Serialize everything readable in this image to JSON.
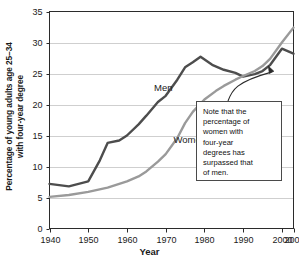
{
  "chart_data": {
    "type": "line",
    "title": "",
    "xlabel": "Year",
    "ylabel_line1": "Percentage of young adults age 25–34",
    "ylabel_line2": "with four-year degree",
    "xlim": [
      1940,
      2003
    ],
    "ylim": [
      0,
      35
    ],
    "grid": true,
    "legend": "inline-series-labels",
    "yticks": [
      "0",
      "5",
      "10",
      "15",
      "20",
      "25",
      "30",
      "35"
    ],
    "ytick_values": [
      0,
      5,
      10,
      15,
      20,
      25,
      30,
      35
    ],
    "xticks": [
      "1940",
      "1950",
      "1960",
      "1970",
      "1980",
      "1990",
      "2000",
      "2003"
    ],
    "xtick_values": [
      1940,
      1950,
      1960,
      1970,
      1980,
      1990,
      2000,
      2003
    ],
    "series": [
      {
        "name": "Men",
        "color": "#4d4d4d",
        "label_x": 1967,
        "label_y": 22.6,
        "x": [
          1940,
          1945,
          1950,
          1953,
          1955,
          1958,
          1960,
          1963,
          1965,
          1968,
          1970,
          1973,
          1975,
          1977,
          1979,
          1982,
          1985,
          1988,
          1990,
          1993,
          1995,
          1997,
          2000,
          2003
        ],
        "values": [
          7.2,
          6.8,
          7.6,
          11.0,
          13.8,
          14.2,
          15.0,
          16.8,
          18.2,
          20.4,
          21.4,
          24.0,
          26.0,
          26.8,
          27.7,
          26.4,
          25.6,
          25.1,
          24.5,
          24.9,
          25.4,
          26.4,
          29.0,
          28.2
        ]
      },
      {
        "name": "Women",
        "color": "#9a9a9a",
        "label_x": 1972,
        "label_y": 14.2,
        "x": [
          1940,
          1945,
          1950,
          1955,
          1960,
          1963,
          1965,
          1968,
          1970,
          1973,
          1975,
          1977,
          1980,
          1983,
          1985,
          1988,
          1990,
          1993,
          1995,
          1997,
          2000,
          2003
        ],
        "values": [
          5.1,
          5.4,
          5.9,
          6.6,
          7.6,
          8.4,
          9.2,
          10.8,
          12.0,
          14.6,
          17.0,
          18.8,
          20.8,
          22.2,
          23.0,
          24.0,
          24.6,
          25.4,
          26.2,
          27.4,
          30.0,
          32.4
        ]
      }
    ],
    "annotations": [
      {
        "name": "crossover-note",
        "text": "Note that the percentage of women with four-year degrees has surpassed that of men.",
        "lines": [
          "Note that the",
          "percentage of",
          "women with",
          "four-year",
          "degrees has",
          "surpassed that",
          "of men."
        ],
        "arrow_target_x": 1996.5,
        "arrow_target_y": 26.2
      }
    ]
  }
}
